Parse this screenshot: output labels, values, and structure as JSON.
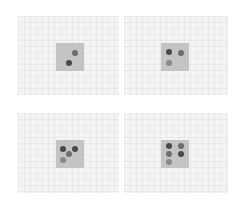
{
  "colors": {
    "page_bg": "#ffffff",
    "panel_bg": "#f4f4f4",
    "square": "#c4c4c4",
    "dot_dark": "#4a4a4a",
    "dot_medium": "#6e6e6e",
    "dot_light": "#8a8a8a"
  },
  "panels": [
    {
      "id": "top-left",
      "box": {
        "x": 18,
        "y": 16,
        "w": 101,
        "h": 79
      },
      "square": {
        "x": 56,
        "y": 43
      },
      "dot_count": 2,
      "dots": [
        {
          "x": 75,
          "y": 53,
          "tone": "dot_medium"
        },
        {
          "x": 69,
          "y": 63,
          "tone": "dot_dark"
        }
      ]
    },
    {
      "id": "top-right",
      "box": {
        "x": 124,
        "y": 16,
        "w": 104,
        "h": 79
      },
      "square": {
        "x": 161,
        "y": 43
      },
      "dot_count": 3,
      "dots": [
        {
          "x": 169,
          "y": 52,
          "tone": "dot_dark"
        },
        {
          "x": 181,
          "y": 53,
          "tone": "dot_medium"
        },
        {
          "x": 169,
          "y": 63,
          "tone": "dot_light"
        }
      ]
    },
    {
      "id": "bottom-left",
      "box": {
        "x": 18,
        "y": 113,
        "w": 101,
        "h": 80
      },
      "square": {
        "x": 56,
        "y": 140
      },
      "dot_count": 4,
      "dots": [
        {
          "x": 63,
          "y": 149,
          "tone": "dot_dark"
        },
        {
          "x": 75,
          "y": 149,
          "tone": "dot_dark"
        },
        {
          "x": 69,
          "y": 154,
          "tone": "dot_medium"
        },
        {
          "x": 63,
          "y": 160,
          "tone": "dot_light"
        }
      ]
    },
    {
      "id": "bottom-right",
      "box": {
        "x": 124,
        "y": 113,
        "w": 104,
        "h": 80
      },
      "square": {
        "x": 161,
        "y": 140
      },
      "dot_count": 5,
      "dots": [
        {
          "x": 169,
          "y": 146,
          "tone": "dot_dark"
        },
        {
          "x": 181,
          "y": 146,
          "tone": "dot_medium"
        },
        {
          "x": 169,
          "y": 154,
          "tone": "dot_medium"
        },
        {
          "x": 181,
          "y": 154,
          "tone": "dot_dark"
        },
        {
          "x": 169,
          "y": 162,
          "tone": "dot_light"
        }
      ]
    }
  ]
}
